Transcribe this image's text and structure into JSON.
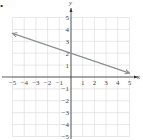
{
  "chart_data": {
    "type": "line",
    "title": "",
    "xlabel": "x",
    "ylabel": "y",
    "xlim": [
      -5,
      5
    ],
    "ylim": [
      -5,
      5
    ],
    "grid": true,
    "x_ticks": [
      -5,
      -4,
      -3,
      -2,
      -1,
      1,
      2,
      3,
      4,
      5
    ],
    "y_ticks": [
      5,
      4,
      3,
      2,
      1,
      -1,
      -2,
      -3,
      -4,
      -5
    ],
    "series": [
      {
        "name": "line",
        "equation": "y = -1/3 x + 2",
        "x": [
          -5,
          0,
          5
        ],
        "y": [
          3.67,
          2,
          0.33
        ],
        "arrows": "both",
        "color": "#8a8f95"
      }
    ]
  },
  "colors": {
    "grid": "#d9d9d9",
    "axis": "#333333",
    "line": "#8a8f95"
  },
  "bullet": "•"
}
